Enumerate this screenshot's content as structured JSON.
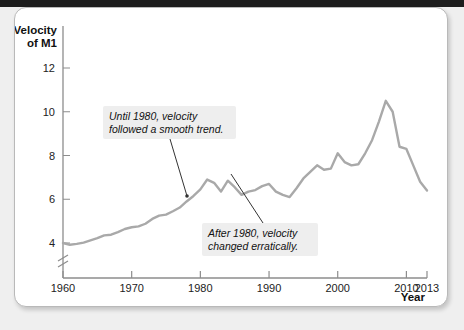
{
  "figure": {
    "background_color": "#efefef",
    "card_color": "#ffffff",
    "border_color": "#b9b9b9"
  },
  "chart_data": {
    "type": "line",
    "title": "",
    "subtitle": "",
    "xlabel": "Year",
    "ylabel": "Velocity of M1",
    "ylabel_line1": "Velocity",
    "ylabel_line2": "of M1",
    "xlim": [
      1960,
      2013
    ],
    "ylim": [
      3.6,
      12.8
    ],
    "y_axis_break": true,
    "grid": false,
    "legend": "none",
    "line_color": "#a9a9a9",
    "line_width": 2.4,
    "x_ticks": [
      1960,
      1970,
      1980,
      1990,
      2000,
      2010,
      2013
    ],
    "x_tick_labels": [
      "1960",
      "1970",
      "1980",
      "1990",
      "2000",
      "2010",
      "2013"
    ],
    "y_ticks": [
      4,
      6,
      8,
      10,
      12
    ],
    "y_tick_labels": [
      "4",
      "6",
      "8",
      "10",
      "12"
    ],
    "series": [
      {
        "name": "Velocity of M1",
        "x": [
          1960,
          1961,
          1962,
          1963,
          1964,
          1965,
          1966,
          1967,
          1968,
          1969,
          1970,
          1971,
          1972,
          1973,
          1974,
          1975,
          1976,
          1977,
          1978,
          1979,
          1980,
          1981,
          1982,
          1983,
          1984,
          1985,
          1986,
          1987,
          1988,
          1989,
          1990,
          1991,
          1992,
          1993,
          1994,
          1995,
          1996,
          1997,
          1998,
          1999,
          2000,
          2001,
          2002,
          2003,
          2004,
          2005,
          2006,
          2007,
          2008,
          2009,
          2010,
          2011,
          2012,
          2013
        ],
        "values": [
          4.0,
          3.92,
          3.96,
          4.02,
          4.12,
          4.22,
          4.35,
          4.38,
          4.5,
          4.64,
          4.72,
          4.76,
          4.88,
          5.1,
          5.25,
          5.3,
          5.45,
          5.62,
          5.9,
          6.15,
          6.45,
          6.9,
          6.75,
          6.35,
          6.85,
          6.55,
          6.2,
          6.35,
          6.42,
          6.6,
          6.7,
          6.35,
          6.2,
          6.1,
          6.5,
          6.95,
          7.25,
          7.55,
          7.35,
          7.4,
          8.1,
          7.7,
          7.55,
          7.6,
          8.1,
          8.7,
          9.55,
          10.5,
          10.0,
          8.4,
          8.3,
          7.55,
          6.8,
          6.4
        ]
      }
    ],
    "annotations": [
      {
        "id": "pre-1980",
        "text_line1": "Until 1980, velocity",
        "text_line2": "followed a smooth trend.",
        "box_x": 88,
        "box_y": 98,
        "box_w": 133,
        "box_h": 33,
        "leader_from_x": 155,
        "leader_from_y": 131,
        "leader_to_x": 172,
        "leader_to_y": 188
      },
      {
        "id": "post-1980",
        "text_line1": "After 1980, velocity",
        "text_line2": "changed erratically.",
        "box_x": 187,
        "box_y": 215,
        "box_w": 116,
        "box_h": 33,
        "leader_from_x": 216,
        "leader_from_y": 166,
        "leader_to_x": 248,
        "leader_to_y": 215
      }
    ],
    "annotation_box_color": "#eeeeee",
    "annotation_text_color": "#111111"
  }
}
